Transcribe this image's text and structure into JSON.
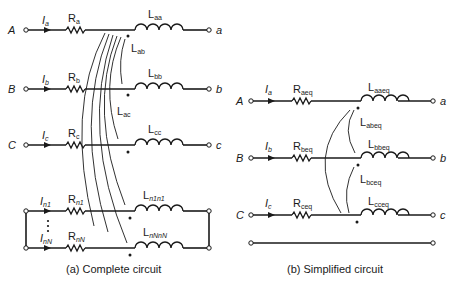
{
  "figure": {
    "complete": {
      "caption": "(a)  Complete circuit",
      "rows": [
        {
          "node_in": "A",
          "node_out": "a",
          "current": "I",
          "current_sub": "a",
          "resistor": "R",
          "resistor_sub": "a",
          "inductor": "L",
          "inductor_sub": "aa"
        },
        {
          "node_in": "B",
          "node_out": "b",
          "current": "I",
          "current_sub": "b",
          "resistor": "R",
          "resistor_sub": "b",
          "inductor": "L",
          "inductor_sub": "bb"
        },
        {
          "node_in": "C",
          "node_out": "c",
          "current": "I",
          "current_sub": "c",
          "resistor": "R",
          "resistor_sub": "c",
          "inductor": "L",
          "inductor_sub": "cc"
        },
        {
          "node_in": "",
          "node_out": "",
          "current": "I",
          "current_sub": "n1",
          "resistor": "R",
          "resistor_sub": "n1",
          "inductor": "L",
          "inductor_sub": "n1n1"
        },
        {
          "node_in": "",
          "node_out": "",
          "current": "I",
          "current_sub": "nN",
          "resistor": "R",
          "resistor_sub": "nN",
          "inductor": "L",
          "inductor_sub": "nNnN"
        }
      ],
      "mutuals": [
        {
          "label": "L",
          "sub": "ab"
        },
        {
          "label": "L",
          "sub": "ac"
        }
      ]
    },
    "simplified": {
      "caption": "(b)  Simplified circuit",
      "rows": [
        {
          "node_in": "A",
          "node_out": "a",
          "current": "I",
          "current_sub": "a",
          "resistor": "R",
          "resistor_sub": "aeq",
          "inductor": "L",
          "inductor_sub": "aaeq"
        },
        {
          "node_in": "B",
          "node_out": "b",
          "current": "I",
          "current_sub": "b",
          "resistor": "R",
          "resistor_sub": "beq",
          "inductor": "L",
          "inductor_sub": "bbeq"
        },
        {
          "node_in": "C",
          "node_out": "c",
          "current": "I",
          "current_sub": "c",
          "resistor": "R",
          "resistor_sub": "ceq",
          "inductor": "L",
          "inductor_sub": "cceq"
        }
      ],
      "mutuals": [
        {
          "label": "L",
          "sub": "abeq"
        },
        {
          "label": "L",
          "sub": "bceq"
        }
      ]
    }
  }
}
